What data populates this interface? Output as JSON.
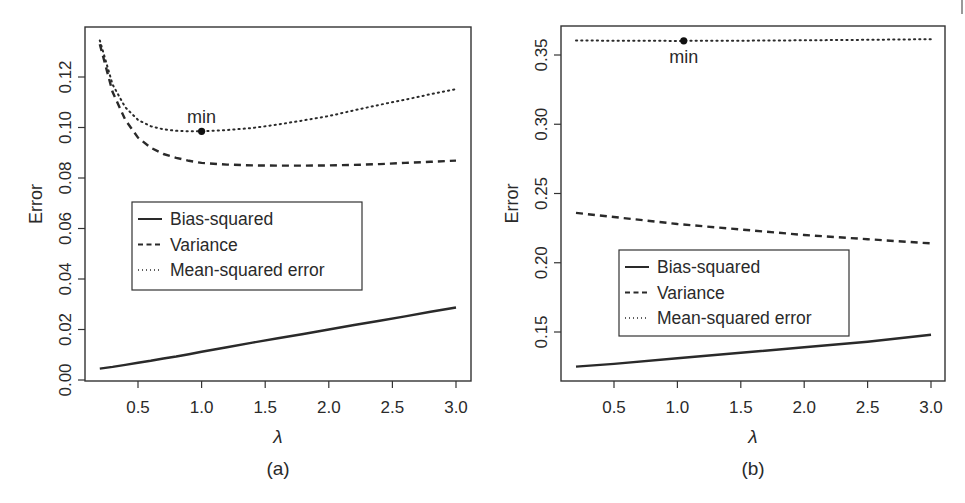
{
  "chart_data": [
    {
      "type": "line",
      "panel_label": "(a)",
      "title": "",
      "xlabel": "λ",
      "ylabel": "Error",
      "xlim": [
        0.2,
        3.0
      ],
      "ylim": [
        0.0,
        0.13
      ],
      "xticks": [
        0.5,
        1.0,
        1.5,
        2.0,
        2.5,
        3.0
      ],
      "xtick_labels": [
        "0.5",
        "1.0",
        "1.5",
        "2.0",
        "2.5",
        "3.0"
      ],
      "yticks": [
        0.0,
        0.02,
        0.04,
        0.06,
        0.08,
        0.1,
        0.12
      ],
      "ytick_labels": [
        "0.00",
        "0.02",
        "0.04",
        "0.06",
        "0.08",
        "0.10",
        "0.12"
      ],
      "grid": false,
      "legend_position": "center-left",
      "x": [
        0.2,
        0.3,
        0.4,
        0.5,
        0.6,
        0.7,
        0.8,
        0.9,
        1.0,
        1.2,
        1.4,
        1.6,
        1.8,
        2.0,
        2.2,
        2.4,
        2.6,
        2.8,
        3.0
      ],
      "series": [
        {
          "name": "Bias-squared",
          "style": "solid",
          "values": [
            0.0045,
            0.0052,
            0.006,
            0.0068,
            0.0076,
            0.0085,
            0.0093,
            0.0102,
            0.0112,
            0.013,
            0.0148,
            0.0165,
            0.0182,
            0.02,
            0.0218,
            0.0235,
            0.0252,
            0.027,
            0.0287
          ]
        },
        {
          "name": "Variance",
          "style": "dashed",
          "values": [
            0.133,
            0.114,
            0.103,
            0.096,
            0.092,
            0.0895,
            0.088,
            0.0868,
            0.086,
            0.0853,
            0.085,
            0.0849,
            0.0849,
            0.085,
            0.0852,
            0.0855,
            0.086,
            0.0864,
            0.0869
          ]
        },
        {
          "name": "Mean-squared error",
          "style": "dotted",
          "values": [
            0.1345,
            0.117,
            0.108,
            0.103,
            0.1005,
            0.0993,
            0.0987,
            0.0985,
            0.0985,
            0.099,
            0.0998,
            0.1012,
            0.1028,
            0.1045,
            0.1068,
            0.109,
            0.111,
            0.1132,
            0.1152
          ]
        }
      ],
      "annotations": [
        {
          "text": "min",
          "x": 1.0,
          "y": 0.0985,
          "label_position": "above"
        }
      ]
    },
    {
      "type": "line",
      "panel_label": "(b)",
      "title": "",
      "xlabel": "λ",
      "ylabel": "Error",
      "xlim": [
        0.2,
        3.0
      ],
      "ylim": [
        0.113,
        0.37
      ],
      "xticks": [
        0.5,
        1.0,
        1.5,
        2.0,
        2.5,
        3.0
      ],
      "xtick_labels": [
        "0.5",
        "1.0",
        "1.5",
        "2.0",
        "2.5",
        "3.0"
      ],
      "yticks": [
        0.15,
        0.2,
        0.25,
        0.3,
        0.35
      ],
      "ytick_labels": [
        "0.15",
        "0.20",
        "0.25",
        "0.30",
        "0.35"
      ],
      "grid": false,
      "legend_position": "bottom-left",
      "x": [
        0.2,
        0.5,
        1.0,
        1.5,
        2.0,
        2.5,
        3.0
      ],
      "series": [
        {
          "name": "Bias-squared",
          "style": "solid",
          "values": [
            0.125,
            0.127,
            0.131,
            0.135,
            0.139,
            0.143,
            0.148
          ]
        },
        {
          "name": "Variance",
          "style": "dashed",
          "values": [
            0.236,
            0.233,
            0.228,
            0.224,
            0.22,
            0.217,
            0.214
          ]
        },
        {
          "name": "Mean-squared error",
          "style": "dotted",
          "values": [
            0.3605,
            0.3603,
            0.3602,
            0.3603,
            0.3606,
            0.361,
            0.3614
          ]
        }
      ],
      "annotations": [
        {
          "text": "min",
          "x": 1.05,
          "y": 0.3602,
          "label_position": "below"
        }
      ]
    }
  ]
}
